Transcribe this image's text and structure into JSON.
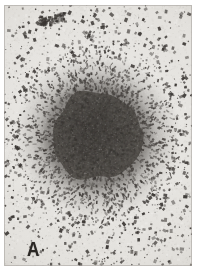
{
  "figure": {
    "panel_label": "A",
    "type": "micrograph"
  },
  "plate": {
    "width": 188,
    "height": 261,
    "margin_left": 4,
    "margin_top": 5
  },
  "colors": {
    "page_background": "#ffffff",
    "film_background": "#e4e2de",
    "film_background_dark": "#d2cfc9",
    "core_dark": "#3f3c39",
    "core_mid": "#4c4945",
    "halo_grain": "#474340",
    "speckle": "#383431",
    "label_color": "#2a2724"
  },
  "colony": {
    "center_x": 97,
    "center_y": 136,
    "core_radius_x": 45,
    "core_radius_y": 44,
    "halo_radius_x": 82,
    "halo_radius_y": 86,
    "core_opacity": 0.92
  },
  "grain": {
    "speckle_count": 2600,
    "halo_grain_count": 5200,
    "background_noise_count": 900,
    "seed": 20240517
  },
  "artifacts": {
    "top_streak": {
      "x": 38,
      "y": 14,
      "width": 26,
      "height": 9,
      "label": "emulsion-streak"
    }
  }
}
